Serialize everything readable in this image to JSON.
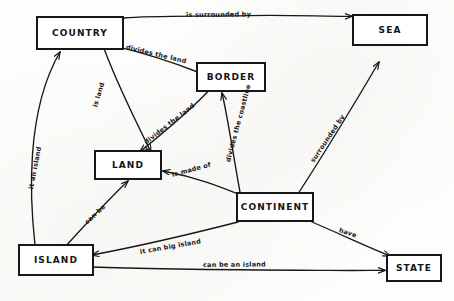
{
  "diagram": {
    "style": "hand-drawn pencil on paper",
    "ink_color": "#17171a",
    "paper_color": "#fdfdfb",
    "nodes": [
      {
        "id": "country",
        "label": "COUNTRY"
      },
      {
        "id": "sea",
        "label": "SEA"
      },
      {
        "id": "border",
        "label": "BORDER"
      },
      {
        "id": "land",
        "label": "LAND"
      },
      {
        "id": "continent",
        "label": "CONTINENT"
      },
      {
        "id": "island",
        "label": "ISLAND"
      },
      {
        "id": "state",
        "label": "STATE"
      }
    ],
    "edges": [
      {
        "id": "country-sea",
        "from": "COUNTRY",
        "to": "SEA",
        "label": "is surrounded by"
      },
      {
        "id": "border-country",
        "from": "BORDER",
        "to": "COUNTRY",
        "label": "divides the land"
      },
      {
        "id": "country-land",
        "from": "COUNTRY",
        "to": "LAND",
        "label": "is land"
      },
      {
        "id": "border-land",
        "from": "BORDER",
        "to": "LAND",
        "label": "divides the land"
      },
      {
        "id": "continent-border",
        "from": "CONTINENT",
        "to": "BORDER",
        "label": "divides the coastline"
      },
      {
        "id": "continent-land",
        "from": "CONTINENT",
        "to": "LAND",
        "label": "is made of"
      },
      {
        "id": "continent-sea",
        "from": "CONTINENT",
        "to": "SEA",
        "label": "surrounded by"
      },
      {
        "id": "island-land",
        "from": "ISLAND",
        "to": "LAND",
        "label": "can be"
      },
      {
        "id": "island-country",
        "from": "ISLAND",
        "to": "COUNTRY",
        "label": "it an island"
      },
      {
        "id": "continent-island",
        "from": "CONTINENT",
        "to": "ISLAND",
        "label": "it can big island"
      },
      {
        "id": "island-state",
        "from": "ISLAND",
        "to": "STATE",
        "label": "can be an island"
      },
      {
        "id": "state-continent",
        "from": "STATE",
        "to": "CONTINENT",
        "label": "have"
      }
    ]
  }
}
